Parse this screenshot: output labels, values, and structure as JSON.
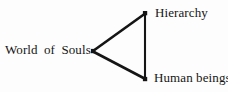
{
  "diagram": {
    "type": "triangle-node-diagram",
    "background_color": "#fdfdfd",
    "stroke_color": "#151515",
    "nodes": [
      {
        "id": "world-of-souls",
        "label": "World of Souls",
        "x": 93,
        "y": 51,
        "label_position": "left"
      },
      {
        "id": "hierarchy",
        "label": "Hierarchy",
        "x": 145,
        "y": 13,
        "label_position": "right"
      },
      {
        "id": "human-beings",
        "label": "Human beings",
        "x": 145,
        "y": 79,
        "label_position": "right"
      }
    ],
    "edges": [
      {
        "id": "edge-souls-hierarchy",
        "from": "world-of-souls",
        "to": "hierarchy"
      },
      {
        "id": "edge-souls-humans",
        "from": "world-of-souls",
        "to": "human-beings"
      },
      {
        "id": "edge-hierarchy-humans",
        "from": "hierarchy",
        "to": "human-beings"
      }
    ]
  }
}
